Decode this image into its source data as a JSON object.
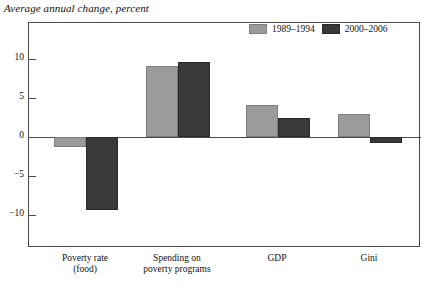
{
  "chart_data": {
    "type": "bar",
    "title": "Average annual change, percent",
    "xlabel": "",
    "ylabel": "",
    "ylim": [
      -13,
      12
    ],
    "yticks": [
      10,
      5,
      0,
      -5,
      -10
    ],
    "ytick_labels": [
      "10",
      "5",
      "0",
      "−5",
      "−10"
    ],
    "grid": false,
    "legend_position": "top-right",
    "categories": [
      "Poverty rate\n(food)",
      "Spending on\npoverty programs",
      "GDP",
      "Gini"
    ],
    "category_lines": [
      [
        "Poverty rate",
        "(food)"
      ],
      [
        "Spending on",
        "poverty programs"
      ],
      [
        "GDP"
      ],
      [
        "Gini"
      ]
    ],
    "series": [
      {
        "name": "1989–1994",
        "color": "#9b9b9b",
        "values": [
          -1.3,
          9.1,
          4.1,
          3.0
        ]
      },
      {
        "name": "2000–2006",
        "color": "#3a3a3a",
        "values": [
          -9.3,
          9.6,
          2.5,
          -0.8
        ]
      }
    ]
  },
  "legend": {
    "items": [
      {
        "label": "1989–1994"
      },
      {
        "label": "2000–2006"
      }
    ]
  },
  "axis": {
    "tick_labels": [
      "10",
      "5",
      "0",
      "−5",
      "−10"
    ]
  }
}
